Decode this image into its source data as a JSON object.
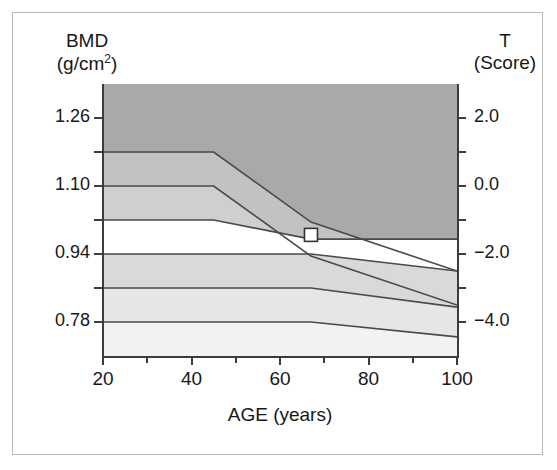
{
  "figure": {
    "left_axis_header_line1": "BMD",
    "left_axis_header_line2_pre": "(g/cm",
    "left_axis_header_line2_sup": "2",
    "left_axis_header_line2_post": ")",
    "right_axis_header_line1": "T",
    "right_axis_header_line2": "(Score)",
    "x_axis_title": "AGE (years)"
  },
  "chart_data": {
    "type": "area",
    "title": "",
    "subtitle": "",
    "xlabel": "AGE (years)",
    "ylabel": "BMD (g/cm2)",
    "y2label": "T (Score)",
    "xlim": [
      20,
      100
    ],
    "ylim_bmd": [
      0.7,
      1.34
    ],
    "ylim_tscore": [
      -5.0,
      3.0
    ],
    "grid": false,
    "legend_position": "none",
    "x_ticks_major": [
      20,
      40,
      60,
      80,
      100
    ],
    "x_tick_labels": [
      "20",
      "40",
      "60",
      "80",
      "100"
    ],
    "x_ticks_minor": [
      30,
      50,
      70,
      90
    ],
    "y_ticks_bmd_major": [
      1.26,
      1.1,
      0.94,
      0.78
    ],
    "y_tick_labels_bmd": [
      "1.26",
      "1.10",
      "0.94",
      "0.78"
    ],
    "y_ticks_bmd_minor": [
      1.18,
      1.02,
      0.86
    ],
    "y_ticks_tscore_major": [
      2.0,
      0.0,
      -2.0,
      -4.0
    ],
    "y_tick_labels_tscore": [
      "2.0",
      "0.0",
      "−2.0",
      "−4.0"
    ],
    "y_ticks_tscore_minor": [
      1.0,
      -1.0,
      -3.0
    ],
    "boundary_lines": [
      {
        "name": "T = +1.0",
        "tscore": 1.0,
        "points": [
          [
            20,
            1.18
          ],
          [
            45,
            1.18
          ],
          [
            67,
            1.015
          ],
          [
            100,
            0.9
          ]
        ]
      },
      {
        "name": "T = 0.0",
        "tscore": 0.0,
        "points": [
          [
            20,
            1.1
          ],
          [
            45,
            1.1
          ],
          [
            67,
            0.935
          ],
          [
            100,
            0.82
          ]
        ]
      },
      {
        "name": "T = -1.0",
        "tscore": -1.0,
        "points": [
          [
            20,
            1.02
          ],
          [
            45,
            1.02
          ],
          [
            67,
            0.975
          ],
          [
            100,
            0.975
          ]
        ]
      },
      {
        "name": "T = -2.0 (lower band start)",
        "tscore": -2.0,
        "points": [
          [
            20,
            0.94
          ],
          [
            45,
            0.94
          ],
          [
            67,
            0.94
          ],
          [
            100,
            0.9
          ]
        ]
      },
      {
        "name": "T = -3.0",
        "tscore": -3.0,
        "points": [
          [
            20,
            0.86
          ],
          [
            45,
            0.86
          ],
          [
            67,
            0.86
          ],
          [
            100,
            0.815
          ]
        ]
      },
      {
        "name": "T = -4.0",
        "tscore": -4.0,
        "points": [
          [
            20,
            0.78
          ],
          [
            45,
            0.78
          ],
          [
            67,
            0.78
          ],
          [
            100,
            0.745
          ]
        ]
      }
    ],
    "band_fills": [
      {
        "name": "band-top-dark",
        "color": "#a9a9a9"
      },
      {
        "name": "band-upper-mid",
        "color": "#c2c2c2"
      },
      {
        "name": "band-lower-mid",
        "color": "#cfcfcf"
      },
      {
        "name": "band-white-gap",
        "color": "#ffffff"
      },
      {
        "name": "band-light-1",
        "color": "#d9d9d9"
      },
      {
        "name": "band-light-2",
        "color": "#e6e6e6"
      },
      {
        "name": "band-light-3",
        "color": "#f2f2f2"
      }
    ],
    "marker": {
      "name": "patient-measurement-marker",
      "shape": "square",
      "fill": "#ffffff",
      "edge": "#333333",
      "age": 67,
      "bmd": 0.985,
      "tscore": -1.0
    },
    "colors": {
      "axis": "#3c3c3c",
      "line": "#4a4a4a",
      "text": "#171717",
      "frame": "#b9b9b9"
    }
  },
  "ticks": {
    "left_labels": [
      {
        "text": "1.26",
        "top": 123
      },
      {
        "text": "1.10",
        "top": 184
      },
      {
        "text": "0.94",
        "top": 262
      },
      {
        "text": "0.78",
        "top": 323
      }
    ],
    "right_labels": [
      {
        "text": "2.0",
        "top": 123
      },
      {
        "text": "0.0",
        "top": 184
      },
      {
        "text": "−2.0",
        "top": 232
      },
      {
        "text": "−4.0",
        "top": 300
      }
    ],
    "bottom_labels": [
      {
        "text": "20",
        "left": 103
      },
      {
        "text": "40",
        "left": 191
      },
      {
        "text": "60",
        "left": 280
      },
      {
        "text": "80",
        "left": 368
      },
      {
        "text": "100",
        "left": 457
      }
    ]
  }
}
